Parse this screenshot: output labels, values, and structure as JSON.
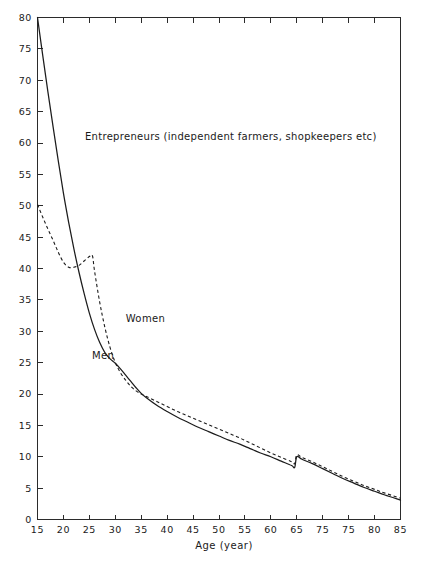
{
  "chart_data": {
    "type": "line",
    "title": "Entrepreneurs (independent farmers, shopkeepers etc)",
    "xlabel": "Age (year)",
    "ylabel": "",
    "xlim": [
      15,
      85
    ],
    "ylim": [
      0,
      80
    ],
    "grid": false,
    "legend_position": "inline-annotations",
    "x_ticks": [
      15,
      20,
      25,
      30,
      35,
      40,
      45,
      50,
      55,
      60,
      65,
      70,
      75,
      80,
      85
    ],
    "x_tick_labels": [
      "15",
      "20",
      "25",
      "30",
      "35",
      "40",
      "45",
      "50",
      "55",
      "60",
      "65",
      "75",
      "75",
      "80",
      "85"
    ],
    "y_ticks": [
      0,
      5,
      10,
      15,
      20,
      25,
      30,
      35,
      40,
      45,
      50,
      55,
      60,
      65,
      70,
      75,
      80
    ],
    "y_tick_labels": [
      "0",
      "5",
      "10",
      "15",
      "20",
      "25",
      "30",
      "35",
      "40",
      "45",
      "50",
      "55",
      "60",
      "65",
      "70",
      "75",
      "80"
    ],
    "series": [
      {
        "name": "Men",
        "style": "solid",
        "label_x": 25.5,
        "label_y": 25.5,
        "x": [
          15,
          16,
          17,
          18,
          19,
          20,
          21,
          22,
          23,
          24,
          25,
          26,
          27,
          28,
          29,
          30,
          31,
          32,
          33,
          34,
          35,
          36,
          38,
          40,
          42,
          44,
          46,
          48,
          50,
          52,
          54,
          56,
          58,
          60,
          62,
          64,
          64.6,
          65,
          66,
          68,
          70,
          72,
          74,
          76,
          78,
          80,
          82,
          85
        ],
        "y": [
          80.0,
          74.0,
          68.2,
          62.6,
          57.2,
          52.0,
          47.4,
          43.2,
          39.4,
          36.0,
          32.9,
          30.3,
          28.2,
          26.6,
          25.6,
          24.9,
          24.0,
          23.0,
          22.0,
          21.0,
          20.1,
          19.4,
          18.2,
          17.2,
          16.3,
          15.5,
          14.7,
          14.0,
          13.3,
          12.6,
          12.0,
          11.3,
          10.6,
          10.0,
          9.3,
          8.6,
          8.3,
          10.0,
          9.6,
          8.9,
          8.1,
          7.3,
          6.5,
          5.8,
          5.1,
          4.5,
          3.9,
          3.1
        ]
      },
      {
        "name": "Women",
        "style": "dashed",
        "label_x": 32.0,
        "label_y": 31.5,
        "x": [
          15,
          16,
          17,
          18,
          19,
          20,
          21,
          22,
          23,
          24,
          25,
          25.6,
          26,
          27,
          28,
          29,
          30,
          31,
          32,
          33,
          34,
          35,
          36,
          38,
          40,
          42,
          44,
          46,
          48,
          50,
          52,
          54,
          56,
          58,
          60,
          62,
          64,
          64.6,
          65,
          66,
          68,
          70,
          72,
          74,
          76,
          78,
          80,
          82,
          85
        ],
        "y": [
          50.2,
          48.2,
          46.3,
          44.5,
          42.6,
          41.0,
          40.2,
          40.2,
          40.5,
          41.2,
          41.9,
          42.0,
          39.6,
          34.6,
          30.6,
          27.4,
          25.0,
          23.4,
          22.2,
          21.2,
          20.5,
          20.0,
          19.6,
          18.8,
          18.0,
          17.2,
          16.5,
          15.8,
          15.1,
          14.4,
          13.7,
          13.0,
          12.2,
          11.4,
          10.6,
          9.9,
          9.2,
          8.9,
          10.3,
          9.9,
          9.2,
          8.4,
          7.6,
          6.8,
          6.1,
          5.4,
          4.8,
          4.2,
          3.4
        ]
      }
    ]
  }
}
